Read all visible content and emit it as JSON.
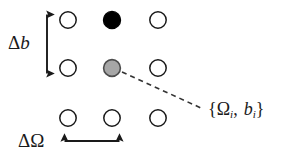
{
  "figure": {
    "background_color": "#ffffff",
    "width": 286,
    "height": 156
  },
  "colors": {
    "stroke": "#1a1a1a",
    "open_fill": "#ffffff",
    "filled_fill": "#000000",
    "highlight_fill": "#a6a6a6",
    "highlight_stroke": "#4d4d4d",
    "dashed_line": "#333333",
    "text": "#1a1a1a"
  },
  "grid": {
    "columns_x": [
      68,
      112,
      158
    ],
    "rows_y": [
      20,
      68,
      118
    ],
    "radius": 8.5,
    "nodes": [
      {
        "row": 0,
        "col": 0,
        "cx": 68,
        "cy": 20,
        "state": "open"
      },
      {
        "row": 0,
        "col": 1,
        "cx": 112,
        "cy": 20,
        "state": "filled"
      },
      {
        "row": 0,
        "col": 2,
        "cx": 158,
        "cy": 20,
        "state": "open"
      },
      {
        "row": 1,
        "col": 0,
        "cx": 68,
        "cy": 68,
        "state": "open"
      },
      {
        "row": 1,
        "col": 1,
        "cx": 112,
        "cy": 68,
        "state": "highlight"
      },
      {
        "row": 1,
        "col": 2,
        "cx": 158,
        "cy": 68,
        "state": "open"
      },
      {
        "row": 2,
        "col": 0,
        "cx": 68,
        "cy": 118,
        "state": "open"
      },
      {
        "row": 2,
        "col": 1,
        "cx": 112,
        "cy": 118,
        "state": "open"
      },
      {
        "row": 2,
        "col": 2,
        "cx": 158,
        "cy": 118,
        "state": "open"
      }
    ]
  },
  "arrows": {
    "vertical": {
      "x": 47,
      "y_start": 12,
      "y_end": 76,
      "label_text": "Δb",
      "label_delta": "Δ",
      "label_var": "b"
    },
    "horizontal": {
      "y": 141,
      "x_start": 62,
      "x_end": 122,
      "label_text": "ΔΩ",
      "label_delta": "Δ",
      "label_var": "Ω"
    }
  },
  "callout": {
    "leader": {
      "x_start": 122,
      "y_start": 72,
      "x_end": 201,
      "y_end": 108,
      "style": "dashed"
    },
    "label_text": "{Ωi, bi}",
    "open_brace": "{",
    "symbol_omega": "Ω",
    "subscript_omega": "i",
    "separator": ",",
    "symbol_b": "b",
    "subscript_b": "i",
    "close_brace": "}"
  }
}
